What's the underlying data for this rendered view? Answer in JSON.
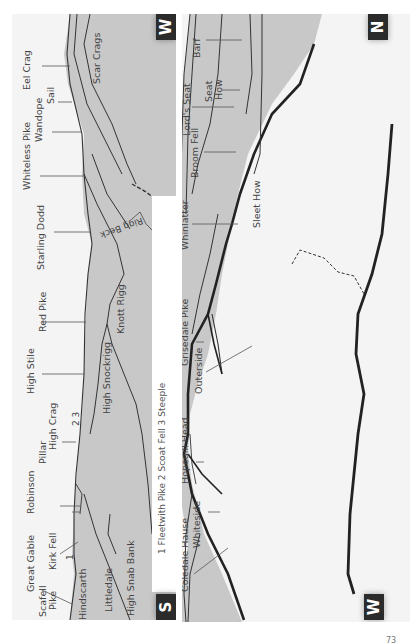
{
  "panels": [
    {
      "id": "south-to-west",
      "start_direction": "S",
      "end_direction": "W",
      "labels": [
        "Great Gable",
        "Scafell",
        "Pike",
        "Kirk Fell",
        "1",
        "Hindscarth",
        "Littledale",
        "High Snab Bank",
        "Robinson",
        "Pillar",
        "High Crag",
        "2 3",
        "High Stile",
        "High Snockrigg",
        "Red Pike",
        "Knott Rigg",
        "Starling Dodd",
        "Rigg Beck",
        "Whiteless Pike",
        "Wandope",
        "Sail",
        "Eel Crag",
        "Scar Crags"
      ],
      "caption": "1 Fleetwith Pike 2 Scoat Fell 3 Steeple"
    },
    {
      "id": "west-to-north",
      "start_direction": "W",
      "end_direction": "N",
      "labels": [
        "Coledale Hause",
        "Whiteside",
        "Hopegill Head",
        "Grisedale Pike",
        "Outerside",
        "Whinlatter",
        "Sleet How",
        "Broom Fell",
        "Lord's Seat",
        "Seat",
        "How",
        "Barf"
      ]
    }
  ],
  "page_number": "73",
  "colors": {
    "fill": "#c8c8c8",
    "background": "#f4f4f4",
    "badge": "#2b2b2b",
    "line": "#333333"
  }
}
